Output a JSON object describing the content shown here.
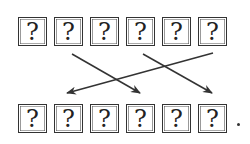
{
  "diagram": {
    "top_row": [
      "?",
      "?",
      "?",
      "?",
      "?",
      "?"
    ],
    "bottom_row": [
      "?",
      "?",
      "?",
      "?",
      "?",
      "?"
    ],
    "arrows": [
      {
        "from": [
          72,
          54
        ],
        "to": [
          140,
          93
        ]
      },
      {
        "from": [
          143,
          54
        ],
        "to": [
          212,
          93
        ]
      },
      {
        "from": [
          213,
          53
        ],
        "to": [
          67,
          93
        ]
      }
    ],
    "trailing_mark": ".",
    "line_color": "#333333"
  }
}
